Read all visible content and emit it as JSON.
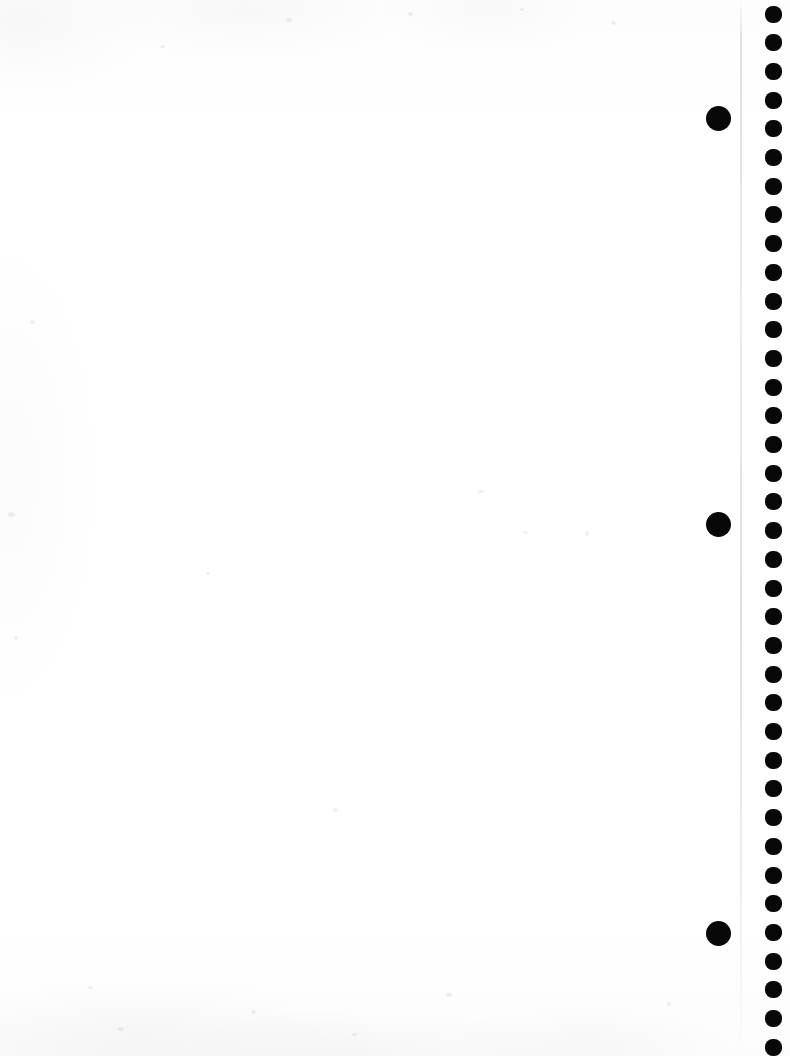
{
  "page": {
    "label": "scanned-blank-page",
    "width": 790,
    "height": 1056,
    "background_color": "#fefefe",
    "body_text": "",
    "caption": ""
  },
  "margin_strip": {
    "crease_line": {
      "name": "crease-line",
      "x": 740,
      "color": "#c6c6ca"
    }
  },
  "large_dots": {
    "name": "large-punch-dots",
    "color": "#080808",
    "diameter": 25,
    "center_x": 718,
    "items": [
      {
        "label": "large-dot-1",
        "cy": 118
      },
      {
        "label": "large-dot-2",
        "cy": 524
      },
      {
        "label": "large-dot-3",
        "cy": 933
      }
    ]
  },
  "dot_column": {
    "name": "small-punch-dot-column",
    "color": "#080808",
    "diameter": 17,
    "center_x": 773,
    "spacing": 28.7,
    "start_y": 14,
    "count": 37,
    "cys": [
      14,
      42.7,
      71.4,
      100.1,
      128.8,
      157.5,
      186.2,
      214.9,
      243.6,
      272.3,
      301,
      329.7,
      358.4,
      387.1,
      415.8,
      444.5,
      473.2,
      501.9,
      530.6,
      559.3,
      588,
      616.7,
      645.4,
      674.1,
      702.8,
      731.5,
      760.2,
      788.9,
      817.6,
      846.3,
      875,
      903.7,
      932.4,
      961.1,
      989.8,
      1018.5,
      1047.2
    ]
  },
  "specks": [
    {
      "x": 30,
      "y": 320,
      "w": 5,
      "h": 4
    },
    {
      "x": 8,
      "y": 512,
      "w": 7,
      "h": 5
    },
    {
      "x": 14,
      "y": 636,
      "w": 4,
      "h": 4
    },
    {
      "x": 160,
      "y": 45,
      "w": 5,
      "h": 3
    },
    {
      "x": 286,
      "y": 18,
      "w": 6,
      "h": 4
    },
    {
      "x": 408,
      "y": 12,
      "w": 5,
      "h": 4
    },
    {
      "x": 520,
      "y": 8,
      "w": 4,
      "h": 3
    },
    {
      "x": 611,
      "y": 21,
      "w": 5,
      "h": 4
    },
    {
      "x": 478,
      "y": 490,
      "w": 6,
      "h": 3
    },
    {
      "x": 585,
      "y": 531,
      "w": 4,
      "h": 5
    },
    {
      "x": 523,
      "y": 531,
      "w": 5,
      "h": 3
    },
    {
      "x": 446,
      "y": 993,
      "w": 6,
      "h": 4
    },
    {
      "x": 251,
      "y": 1010,
      "w": 5,
      "h": 4
    },
    {
      "x": 118,
      "y": 1027,
      "w": 6,
      "h": 4
    },
    {
      "x": 352,
      "y": 1033,
      "w": 5,
      "h": 3
    },
    {
      "x": 667,
      "y": 1002,
      "w": 4,
      "h": 4
    },
    {
      "x": 88,
      "y": 986,
      "w": 5,
      "h": 3
    },
    {
      "x": 206,
      "y": 572,
      "w": 4,
      "h": 3
    },
    {
      "x": 333,
      "y": 808,
      "w": 5,
      "h": 4
    }
  ]
}
